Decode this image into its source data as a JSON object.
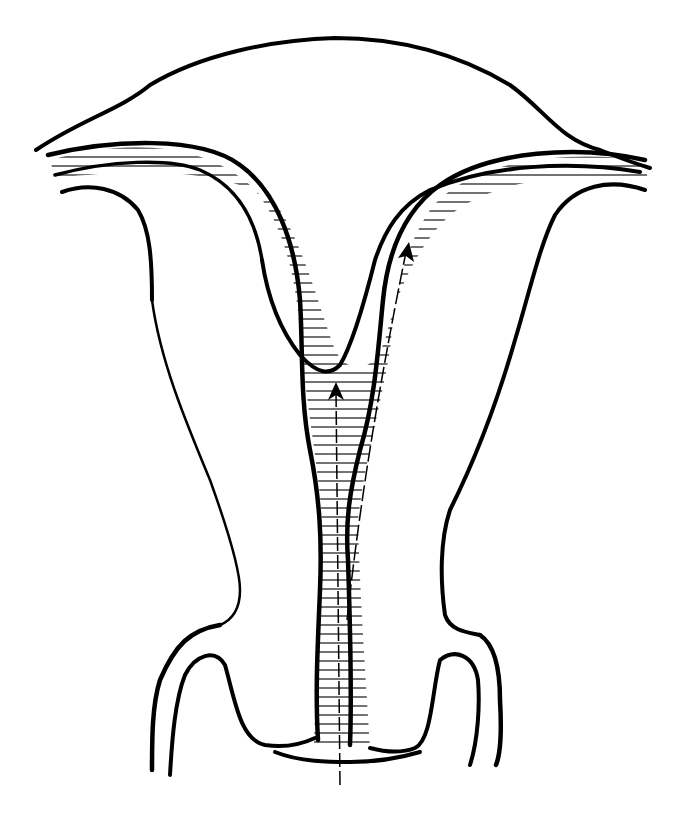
{
  "figure": {
    "type": "anatomical line drawing",
    "background": "#ffffff",
    "ink": "#000000",
    "arrows": [
      {
        "name": "central-arrow",
        "from": [
          340,
          785
        ],
        "to": [
          336,
          385
        ]
      },
      {
        "name": "right-horn-arrow",
        "from": [
          345,
          620
        ],
        "to": [
          407,
          245
        ]
      }
    ],
    "text_labels": []
  }
}
